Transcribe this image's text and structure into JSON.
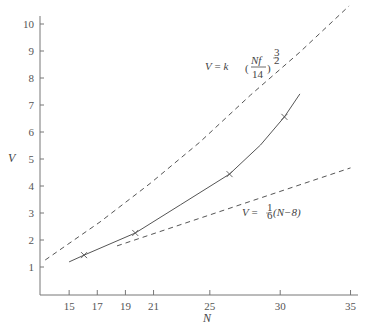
{
  "chart_data": {
    "type": "line",
    "title": "",
    "xlabel": "N",
    "ylabel": "V",
    "xlim": [
      13,
      35.5
    ],
    "ylim": [
      0,
      10.5
    ],
    "x_ticks": [
      15,
      17,
      19,
      21,
      25,
      30,
      35
    ],
    "y_ticks": [
      1,
      2,
      3,
      4,
      5,
      6,
      7,
      8,
      9,
      10
    ],
    "grid": false,
    "series": [
      {
        "name": "V = k(Nf/14)^(3/2)",
        "style": "dashed",
        "x": [
          13.3,
          17.2,
          20.8,
          24.3,
          27.9,
          31.4,
          34.9
        ],
        "y": [
          1.26,
          2.67,
          4.11,
          5.63,
          7.37,
          8.96,
          10.67
        ]
      },
      {
        "name": "measured",
        "style": "solid",
        "x": [
          15.0,
          16.06,
          19.7,
          22.9,
          26.4,
          28.6,
          30.3,
          31.4
        ],
        "y": [
          1.19,
          1.44,
          2.26,
          3.3,
          4.44,
          5.52,
          6.56,
          7.41
        ]
      },
      {
        "name": "V = 1/6(N-8)",
        "style": "dashed",
        "x": [
          18.4,
          35
        ],
        "y": [
          1.78,
          4.67
        ]
      }
    ],
    "markers": {
      "symbol": "x",
      "x": [
        16.06,
        19.7,
        26.4,
        30.3
      ],
      "y": [
        1.44,
        2.26,
        4.44,
        6.56
      ]
    },
    "annotations": [
      {
        "text": "V = k(Nf/14)^(3/2)",
        "near_series": 0
      },
      {
        "text": "V = 1/6(N-8)",
        "near_series": 2
      }
    ]
  },
  "labels": {
    "x_axis": "N",
    "y_axis": "V",
    "x_ticks": [
      "15",
      "17",
      "19",
      "21",
      "25",
      "30",
      "35"
    ],
    "y_ticks": [
      "1",
      "2",
      "3",
      "4",
      "5",
      "6",
      "7",
      "8",
      "9",
      "10"
    ],
    "eq_upper": {
      "lhs": "V",
      "eq": " = ",
      "k": "k",
      "num": "Nf",
      "den": "14",
      "exp_num": "3",
      "exp_den": "2"
    },
    "eq_lower": {
      "lhs": "V",
      "eq": " = ",
      "frac_num": "1",
      "frac_den": "6",
      "rest": "(N−8)"
    }
  }
}
